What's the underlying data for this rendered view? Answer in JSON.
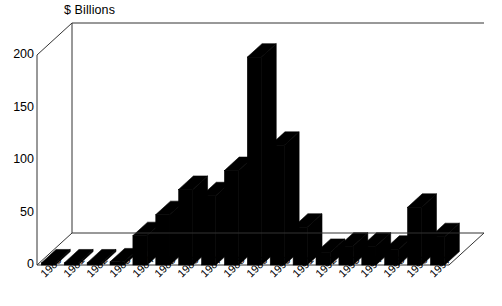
{
  "chart_data": {
    "type": "bar",
    "title": "$ Billions",
    "xlabel": "",
    "ylabel": "",
    "ylim": [
      0,
      200
    ],
    "yticks": [
      0,
      50,
      100,
      150,
      200
    ],
    "grid": false,
    "legend": null,
    "style": "3d-bar",
    "bar_color": "#000000",
    "background_color": "#ffffff",
    "axis_color": "#222222",
    "categories": [
      "1980",
      "1981",
      "1982",
      "1983",
      "1984",
      "1985",
      "1986",
      "1987",
      "1988",
      "1989",
      "1990",
      "1991",
      "1992",
      "1993",
      "1994",
      "1995",
      "1996",
      "1997"
    ],
    "values": [
      2,
      2,
      2,
      3,
      28,
      48,
      72,
      66,
      90,
      198,
      114,
      36,
      12,
      18,
      18,
      15,
      55,
      27
    ]
  }
}
